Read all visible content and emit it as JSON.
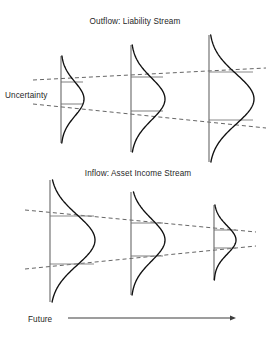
{
  "figure": {
    "background_color": "#ffffff",
    "curve_color": "#101010",
    "axis_color": "#6e6e6e",
    "envelope_color": "#4a4a4a",
    "connector_color": "#8a8a8a",
    "arrow_color": "#3d3d3d"
  },
  "panels": [
    {
      "id": "outflow",
      "title": "Outflow: Liability Stream",
      "title_x": 135,
      "title_y": 24
    },
    {
      "id": "inflow",
      "title": "Inflow: Asset Income Stream",
      "title_x": 138,
      "title_y": 176
    }
  ],
  "labels": {
    "uncertainty": "Uncertainty",
    "uncertainty_x": 5,
    "uncertainty_y": 98,
    "future": "Future",
    "future_x": 28,
    "future_y": 322
  },
  "chart_data": {
    "type": "line",
    "subtitle": "",
    "xlabel": "Future",
    "ylabel": "Uncertainty",
    "grid": false,
    "legend": false,
    "annotations": [
      "Uncertainty",
      "Future",
      "Outflow: Liability Stream",
      "Inflow: Asset Income Stream"
    ],
    "series": [
      {
        "name": "outflow-distributions",
        "panel": "outflow",
        "orientation": "horizontal-density",
        "distributions": [
          {
            "index": 1,
            "axis_x": 61,
            "center_y": 99,
            "sigma_y": 17,
            "amplitude_x": 23,
            "top_y": 56,
            "bottom_y": 143
          },
          {
            "index": 2,
            "axis_x": 131,
            "center_y": 99,
            "sigma_y": 21,
            "amplitude_x": 34,
            "top_y": 45,
            "bottom_y": 152
          },
          {
            "index": 3,
            "axis_x": 209,
            "center_y": 99,
            "sigma_y": 25,
            "amplitude_x": 45,
            "top_y": 35,
            "bottom_y": 162
          }
        ],
        "envelopes": [
          {
            "name": "upper",
            "x1": 33,
            "y1": 80,
            "x2": 266,
            "y2": 68
          },
          {
            "name": "lower",
            "x1": 33,
            "y1": 104,
            "x2": 266,
            "y2": 128
          }
        ],
        "connectors": [
          {
            "x1": 61,
            "y1": 82,
            "x2": 83,
            "y2": 82
          },
          {
            "x1": 61,
            "y1": 104,
            "x2": 83,
            "y2": 104
          },
          {
            "x1": 131,
            "y1": 77,
            "x2": 163,
            "y2": 77
          },
          {
            "x1": 131,
            "y1": 111,
            "x2": 163,
            "y2": 111
          },
          {
            "x1": 209,
            "y1": 72,
            "x2": 253,
            "y2": 72
          },
          {
            "x1": 209,
            "y1": 120,
            "x2": 253,
            "y2": 120
          }
        ]
      },
      {
        "name": "inflow-distributions",
        "panel": "inflow",
        "orientation": "horizontal-density",
        "distributions": [
          {
            "index": 1,
            "axis_x": 50,
            "center_y": 240,
            "sigma_y": 25,
            "amplitude_x": 45,
            "top_y": 180,
            "bottom_y": 302
          },
          {
            "index": 2,
            "axis_x": 131,
            "center_y": 240,
            "sigma_y": 21,
            "amplitude_x": 34,
            "top_y": 192,
            "bottom_y": 295
          },
          {
            "index": 3,
            "axis_x": 214,
            "center_y": 240,
            "sigma_y": 14,
            "amplitude_x": 22,
            "top_y": 205,
            "bottom_y": 280
          }
        ],
        "envelopes": [
          {
            "name": "upper",
            "x1": 25,
            "y1": 210,
            "x2": 256,
            "y2": 232
          },
          {
            "name": "lower",
            "x1": 25,
            "y1": 269,
            "x2": 256,
            "y2": 246
          }
        ],
        "connectors": [
          {
            "x1": 50,
            "y1": 216,
            "x2": 94,
            "y2": 216
          },
          {
            "x1": 50,
            "y1": 264,
            "x2": 94,
            "y2": 264
          },
          {
            "x1": 131,
            "y1": 223,
            "x2": 163,
            "y2": 223
          },
          {
            "x1": 131,
            "y1": 256,
            "x2": 163,
            "y2": 256
          },
          {
            "x1": 214,
            "y1": 230,
            "x2": 236,
            "y2": 230
          },
          {
            "x1": 214,
            "y1": 248,
            "x2": 236,
            "y2": 248
          }
        ]
      }
    ],
    "time_axis": {
      "x1": 68,
      "y": 318,
      "x2": 236,
      "arrow": "right"
    }
  }
}
